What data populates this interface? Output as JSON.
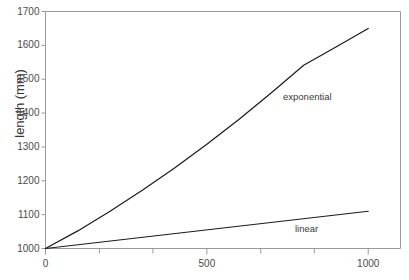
{
  "chart_data": {
    "type": "line",
    "title": "",
    "xlabel": "",
    "ylabel": "length (mm)",
    "xlim": [
      0,
      1100
    ],
    "ylim": [
      1000,
      1700
    ],
    "grid": false,
    "legend_position": "inline-annotation",
    "x_ticks": [
      {
        "value": 0,
        "label": "0",
        "major": true
      },
      {
        "value": 167,
        "label": "",
        "major": false
      },
      {
        "value": 333,
        "label": "",
        "major": false
      },
      {
        "value": 500,
        "label": "500",
        "major": true
      },
      {
        "value": 667,
        "label": "",
        "major": false
      },
      {
        "value": 833,
        "label": "",
        "major": false
      },
      {
        "value": 1000,
        "label": "1000",
        "major": true
      }
    ],
    "y_ticks": [
      {
        "value": 1000,
        "label": "1000"
      },
      {
        "value": 1100,
        "label": "1100"
      },
      {
        "value": 1200,
        "label": "1200"
      },
      {
        "value": 1300,
        "label": "1300"
      },
      {
        "value": 1400,
        "label": "1400"
      },
      {
        "value": 1500,
        "label": "1500"
      },
      {
        "value": 1600,
        "label": "1600"
      },
      {
        "value": 1700,
        "label": "1700"
      }
    ],
    "series": [
      {
        "name": "exponential",
        "annotation": "exponential",
        "color": "#1a1a1a",
        "x": [
          0,
          100,
          200,
          300,
          400,
          500,
          600,
          700,
          800,
          900,
          1000
        ],
        "values": [
          1000,
          1052,
          1110,
          1172,
          1238,
          1308,
          1382,
          1460,
          1541,
          1595,
          1650
        ]
      },
      {
        "name": "linear",
        "annotation": "linear",
        "color": "#1a1a1a",
        "x": [
          0,
          1000
        ],
        "values": [
          1000,
          1110
        ]
      }
    ]
  },
  "annotations": {
    "exponential_label": "exponential",
    "linear_label": "linear"
  },
  "colors": {
    "frame": "#9a9a9a",
    "line": "#1a1a1a",
    "text": "#3c3c3c",
    "background": "#ffffff"
  }
}
